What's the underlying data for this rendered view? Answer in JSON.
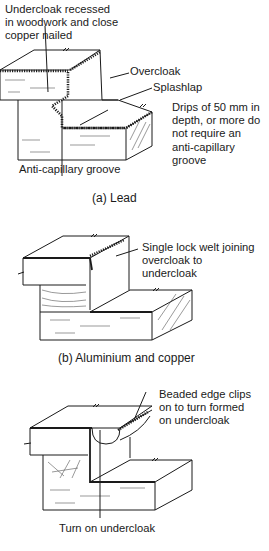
{
  "figure_a": {
    "labels": {
      "undercloak": "Undercloak recessed\nin woodwork and close\ncopper nailed",
      "overcloak": "Overcloak",
      "splashlap": "Splashlap",
      "drips_note": "Drips of 50 mm in\ndepth, or more do\nnot require an\nanti-capillary\ngroove",
      "groove": "Anti-capillary groove"
    },
    "caption": "(a) Lead"
  },
  "figure_b": {
    "labels": {
      "welt": "Single lock welt joining\novercloak to\nundercloak"
    },
    "caption": "(b) Aluminium and copper"
  },
  "figure_c": {
    "labels": {
      "beaded": "Beaded edge clips\non to turn formed\non undercloak",
      "turn": "Turn on undercloak"
    }
  }
}
